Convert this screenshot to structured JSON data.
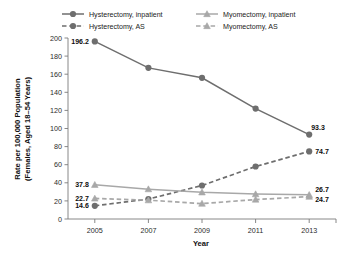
{
  "chart_data": {
    "type": "line",
    "title": "",
    "xlabel": "Year",
    "ylabel": "Rate per 100,000 Population (Females, Aged 18–54 Years)",
    "ylabel_line1": "Rate per 100,000 Population",
    "ylabel_line2": "(Females, Aged 18–54 Years)",
    "categories": [
      "2005",
      "2007",
      "2009",
      "2011",
      "2013"
    ],
    "x": [
      2005,
      2007,
      2009,
      2011,
      2013
    ],
    "ylim": [
      0,
      200
    ],
    "yticks": [
      "0",
      "20",
      "40",
      "60",
      "80",
      "100",
      "120",
      "140",
      "160",
      "180",
      "200"
    ],
    "ytick_values": [
      0,
      20,
      40,
      60,
      80,
      100,
      120,
      140,
      160,
      180,
      200
    ],
    "grid": false,
    "legend_position": "top",
    "series": [
      {
        "name": "Hysterectomy, inpatient",
        "values": [
          196.2,
          167.0,
          156.0,
          122.0,
          93.3
        ],
        "color": "#6e6e6e",
        "style": "solid",
        "marker": "circle",
        "labels": [
          {
            "index": 0,
            "text": "196.2"
          },
          {
            "index": 4,
            "text": "93.3"
          }
        ]
      },
      {
        "name": "Hysterectomy, AS",
        "values": [
          14.6,
          22.0,
          37.0,
          58.0,
          74.7
        ],
        "color": "#6e6e6e",
        "style": "dashed",
        "marker": "circle",
        "labels": [
          {
            "index": 0,
            "text": "14.6"
          },
          {
            "index": 4,
            "text": "74.7"
          }
        ]
      },
      {
        "name": "Myomectomy, inpatient",
        "values": [
          37.8,
          33.0,
          29.5,
          27.5,
          26.7
        ],
        "color": "#a8a8a8",
        "style": "solid",
        "marker": "triangle",
        "labels": [
          {
            "index": 0,
            "text": "37.8"
          },
          {
            "index": 4,
            "text": "26.7"
          }
        ]
      },
      {
        "name": "Myomectomy, AS",
        "values": [
          22.7,
          20.8,
          17.0,
          21.5,
          24.7
        ],
        "color": "#a8a8a8",
        "style": "dashed",
        "marker": "triangle",
        "labels": [
          {
            "index": 0,
            "text": "22.7"
          },
          {
            "index": 4,
            "text": "24.7"
          }
        ]
      }
    ],
    "legend": [
      {
        "label": "Hysterectomy, inpatient",
        "color": "#6e6e6e",
        "style": "solid",
        "marker": "circle"
      },
      {
        "label": "Myomectomy, inpatient",
        "color": "#a8a8a8",
        "style": "solid",
        "marker": "triangle"
      },
      {
        "label": "Hysterectomy, AS",
        "color": "#6e6e6e",
        "style": "dashed",
        "marker": "circle"
      },
      {
        "label": "Myomectomy, AS",
        "color": "#a8a8a8",
        "style": "dashed",
        "marker": "triangle"
      }
    ],
    "colors": {
      "dark_series": "#6e6e6e",
      "light_series": "#a8a8a8",
      "axis": "#7a7a7a",
      "text": "#111111",
      "background": "#ffffff"
    }
  }
}
